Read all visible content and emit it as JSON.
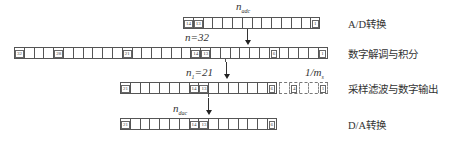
{
  "stages": [
    {
      "label": "A/D转换",
      "symbol": "n",
      "symbol_sub": "adc",
      "cells": [
        "14",
        "13",
        "",
        "",
        "",
        "",
        "",
        "",
        "",
        "",
        "",
        "",
        "",
        "1"
      ]
    },
    {
      "label": "数字解调与积分",
      "symbol": "n=32",
      "cells": [
        "32",
        "",
        "",
        "",
        "28",
        "",
        "",
        "",
        "",
        "",
        "",
        "21",
        "",
        "",
        "",
        "",
        "",
        "",
        "14",
        "13",
        "",
        "",
        "",
        "",
        "",
        "",
        "6",
        "",
        "",
        "",
        "",
        "1"
      ]
    },
    {
      "label": "采样滤波与数字输出",
      "symbol": "n",
      "symbol_sub": "1",
      "symbol_suffix": "=21",
      "cells": [
        "21",
        "",
        "",
        "",
        "",
        "",
        "",
        "14",
        "13",
        "",
        "",
        "",
        "",
        "",
        "",
        "6"
      ],
      "dashed_cells": [
        "",
        "4",
        "",
        "",
        "1"
      ],
      "dashed_label": "1/m",
      "dashed_label_sub": "s"
    },
    {
      "label": "D/A转换",
      "symbol": "n",
      "symbol_sub": "dac",
      "cells": [
        "21",
        "",
        "",
        "",
        "",
        "",
        "",
        "14",
        "13",
        "",
        "",
        "",
        "",
        "",
        "",
        "6"
      ]
    }
  ],
  "colors": {
    "line": "#555555",
    "text": "#333333",
    "background": "#ffffff"
  }
}
